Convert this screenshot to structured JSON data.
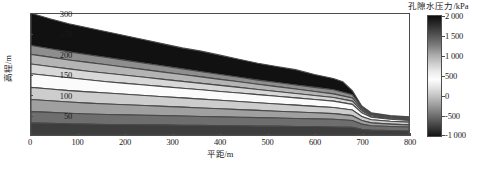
{
  "chart_data": {
    "type": "contour",
    "title": "",
    "xlabel": "平距/m",
    "ylabel": "高程/m",
    "xlim": [
      0,
      800
    ],
    "ylim": [
      0,
      300
    ],
    "xticks": [
      "0",
      "100",
      "200",
      "300",
      "400",
      "500",
      "600",
      "700",
      "800"
    ],
    "xtick_values": [
      0,
      100,
      200,
      300,
      400,
      500,
      600,
      700,
      800
    ],
    "yticks": [
      "50",
      "100",
      "150",
      "200",
      "250",
      "300"
    ],
    "ytick_values": [
      50,
      100,
      150,
      200,
      250,
      300
    ],
    "grid": false,
    "colorbar": {
      "label": "孔隙水压力/kPa",
      "ticks": [
        "2 000",
        "1 500",
        "1 000",
        "500",
        "0",
        "-500",
        "-1 000"
      ],
      "tick_values": [
        2000,
        1500,
        1000,
        500,
        0,
        -500,
        -1000
      ],
      "vmin": -1000,
      "vmax": 2000,
      "colormap": "grayscale-diverging",
      "position": "right"
    },
    "contour_levels": [
      -1000,
      -750,
      -500,
      -250,
      0,
      250,
      500,
      750,
      1000,
      1250,
      1500,
      1750,
      2000
    ],
    "terrain_profile": {
      "x": [
        0,
        40,
        80,
        120,
        160,
        200,
        240,
        280,
        320,
        360,
        400,
        440,
        480,
        520,
        560,
        600,
        640,
        660,
        680,
        700,
        720,
        760,
        800
      ],
      "y": [
        302,
        288,
        276,
        266,
        256,
        246,
        236,
        226,
        216,
        208,
        198,
        188,
        178,
        170,
        162,
        150,
        140,
        132,
        110,
        72,
        55,
        48,
        45
      ]
    },
    "bands": [
      {
        "level_label": "2 000",
        "value": 2000,
        "color": "#111111",
        "top_x": [
          0,
          40,
          80,
          120,
          160,
          200,
          240,
          280,
          320,
          360,
          400,
          440,
          480,
          520,
          560,
          600,
          640,
          660,
          680,
          700,
          720,
          760,
          800
        ],
        "top_y": [
          302,
          288,
          276,
          266,
          256,
          246,
          236,
          226,
          216,
          208,
          198,
          188,
          178,
          170,
          162,
          150,
          140,
          132,
          110,
          72,
          55,
          48,
          45
        ],
        "bot_x": [
          0,
          40,
          80,
          120,
          160,
          200,
          240,
          280,
          320,
          360,
          400,
          440,
          480,
          520,
          560,
          600,
          640,
          680,
          700,
          720,
          760,
          800
        ],
        "bot_y": [
          222,
          214,
          206,
          199,
          192,
          185,
          178,
          171,
          164,
          157,
          150,
          143,
          136,
          130,
          124,
          118,
          112,
          100,
          68,
          52,
          45,
          42
        ]
      },
      {
        "level_label": "1 500",
        "value": 1500,
        "color": "#8e8e8e",
        "top_y": [
          222,
          214,
          206,
          199,
          192,
          185,
          178,
          171,
          164,
          157,
          150,
          143,
          136,
          130,
          124,
          118,
          112,
          100,
          68,
          52,
          45,
          42
        ],
        "bot_y": [
          200,
          193,
          186,
          180,
          174,
          168,
          162,
          156,
          150,
          144,
          138,
          132,
          126,
          120,
          114,
          108,
          102,
          92,
          64,
          50,
          43,
          40
        ]
      },
      {
        "level_label": "1 000",
        "value": 1000,
        "color": "#b4b4b4",
        "top_y": [
          200,
          193,
          186,
          180,
          174,
          168,
          162,
          156,
          150,
          144,
          138,
          132,
          126,
          120,
          114,
          108,
          102,
          92,
          64,
          50,
          43,
          40
        ],
        "bot_y": [
          176,
          170,
          164,
          158,
          153,
          148,
          143,
          138,
          133,
          128,
          123,
          118,
          113,
          108,
          103,
          98,
          93,
          84,
          60,
          47,
          41,
          38
        ]
      },
      {
        "level_label": "750",
        "value": 750,
        "color": "#d8d8d8",
        "top_y": [
          176,
          170,
          164,
          158,
          153,
          148,
          143,
          138,
          133,
          128,
          123,
          118,
          113,
          108,
          103,
          98,
          93,
          84,
          60,
          47,
          41,
          38
        ],
        "bot_y": [
          152,
          147,
          142,
          137,
          132,
          128,
          124,
          120,
          116,
          112,
          108,
          104,
          100,
          96,
          92,
          88,
          84,
          76,
          55,
          44,
          39,
          36
        ]
      },
      {
        "level_label": "500",
        "value": 500,
        "color": "#fbfbfb",
        "top_y": [
          152,
          147,
          142,
          137,
          132,
          128,
          124,
          120,
          116,
          112,
          108,
          104,
          100,
          96,
          92,
          88,
          84,
          76,
          55,
          44,
          39,
          36
        ],
        "bot_y": [
          118,
          114,
          110,
          107,
          104,
          101,
          98,
          95,
          92,
          89,
          86,
          83,
          80,
          77,
          74,
          71,
          68,
          62,
          46,
          38,
          34,
          32
        ]
      },
      {
        "level_label": "250",
        "value": 250,
        "color": "#cdcdcd",
        "top_y": [
          118,
          114,
          110,
          107,
          104,
          101,
          98,
          95,
          92,
          89,
          86,
          83,
          80,
          77,
          74,
          71,
          68,
          62,
          46,
          38,
          34,
          32
        ],
        "bot_y": [
          88,
          85,
          82,
          79,
          77,
          75,
          73,
          71,
          69,
          67,
          65,
          63,
          61,
          59,
          57,
          55,
          53,
          48,
          36,
          30,
          27,
          25
        ]
      },
      {
        "level_label": "0",
        "value": 0,
        "color": "#a0a0a0",
        "top_y": [
          88,
          85,
          82,
          79,
          77,
          75,
          73,
          71,
          69,
          67,
          65,
          63,
          61,
          59,
          57,
          55,
          53,
          48,
          36,
          30,
          27,
          25
        ],
        "bot_y": [
          58,
          56,
          54,
          52,
          51,
          50,
          49,
          48,
          47,
          46,
          45,
          44,
          43,
          42,
          41,
          40,
          39,
          36,
          27,
          23,
          21,
          20
        ]
      },
      {
        "level_label": "-500",
        "value": -500,
        "color": "#6e6e6e",
        "top_y": [
          58,
          56,
          54,
          52,
          51,
          50,
          49,
          48,
          47,
          46,
          45,
          44,
          43,
          42,
          41,
          40,
          39,
          36,
          27,
          23,
          21,
          20
        ],
        "bot_y": [
          30,
          29,
          28,
          27,
          26,
          26,
          25,
          25,
          24,
          24,
          23,
          23,
          22,
          22,
          21,
          21,
          20,
          19,
          14,
          12,
          11,
          10
        ]
      },
      {
        "level_label": "-1 000",
        "value": -1000,
        "color": "#3d3d3d",
        "top_y": [
          30,
          29,
          28,
          27,
          26,
          26,
          25,
          25,
          24,
          24,
          23,
          23,
          22,
          22,
          21,
          21,
          20,
          19,
          14,
          12,
          11,
          10
        ],
        "bot_y": [
          0,
          0,
          0,
          0,
          0,
          0,
          0,
          0,
          0,
          0,
          0,
          0,
          0,
          0,
          0,
          0,
          0,
          0,
          0,
          0,
          0,
          0
        ]
      }
    ]
  },
  "axes": {
    "xlabel": "平距/m",
    "ylabel": "高程/m",
    "xticks": [
      "0",
      "100",
      "200",
      "300",
      "400",
      "500",
      "600",
      "700",
      "800"
    ],
    "yticks": [
      "300",
      "250",
      "200",
      "150",
      "100",
      "50"
    ]
  },
  "colorbar": {
    "title": "孔隙水压力/kPa",
    "ticks": [
      "2 000",
      "1 500",
      "1 000",
      "500",
      "0",
      "-500",
      "-1 000"
    ]
  }
}
